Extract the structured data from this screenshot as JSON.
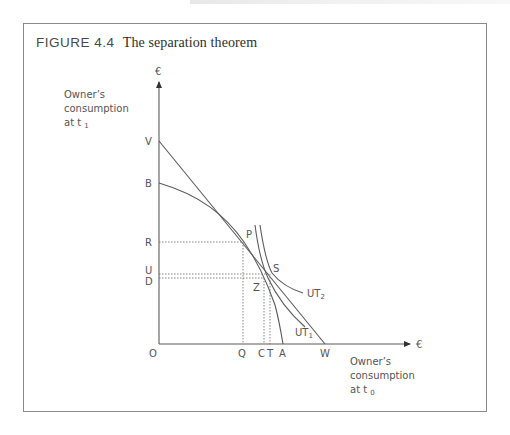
{
  "figure": {
    "number": "FIGURE 4.4",
    "title": "The separation theorem"
  },
  "axes": {
    "y_axis": {
      "unit": "€",
      "title_lines": [
        "Owner’s",
        "consumption",
        "at t"
      ],
      "title_subscript": "1"
    },
    "x_axis": {
      "unit": "€",
      "title_lines": [
        "Owner’s",
        "consumption",
        "at t"
      ],
      "title_subscript": "0"
    },
    "origin": "O"
  },
  "points": {
    "y_labels": {
      "V": "V",
      "B": "B",
      "R": "R",
      "U": "U",
      "D": "D"
    },
    "x_labels": {
      "Q": "Q",
      "C": "C",
      "T": "T",
      "A": "A",
      "W": "W"
    },
    "curve_points": {
      "P": "P",
      "S": "S",
      "Z": "Z"
    }
  },
  "curves": {
    "ut1": {
      "label": "UT",
      "subscript": "1"
    },
    "ut2": {
      "label": "UT",
      "subscript": "2"
    },
    "market_line": {
      "from": "V",
      "to": "W"
    },
    "investment_frontier": {
      "from": "B",
      "to": "A"
    }
  },
  "colors": {
    "line": "#5a5a5a",
    "frame": "#8a8a8a",
    "text": "#555555",
    "dotted": "#777777"
  }
}
